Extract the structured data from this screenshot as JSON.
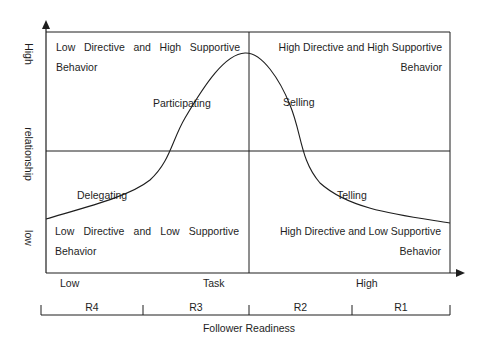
{
  "diagram": {
    "colors": {
      "line": "#1e1e1e",
      "text": "#1e1e1e",
      "background": "#ffffff"
    },
    "y_axis": {
      "high_label": "High",
      "name_label": "relationship",
      "low_label": "low"
    },
    "x_axis": {
      "low_label": "Low",
      "name_label": "Task",
      "high_label": "High"
    },
    "quadrants": {
      "top_left": {
        "line1": "Low Directive and High Supportive",
        "line2": "Behavior"
      },
      "top_right": {
        "line1": "High Directive and High Supportive",
        "line2": "Behavior"
      },
      "bottom_left": {
        "line1": "Low Directive and Low Supportive",
        "line2": "Behavior"
      },
      "bottom_right": {
        "line1": "High Directive and Low Supportive",
        "line2": "Behavior"
      }
    },
    "curve_labels": {
      "participating": "Participating",
      "selling": "Selling",
      "delegating": "Delegating",
      "telling": "Telling"
    },
    "readiness": {
      "segments": [
        "R4",
        "R3",
        "R2",
        "R1"
      ],
      "title": "Follower Readiness"
    }
  }
}
